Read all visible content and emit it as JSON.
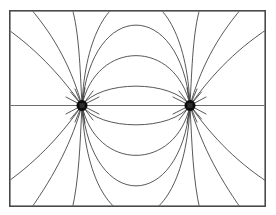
{
  "figure": {
    "background_color": "#ffffff",
    "frame": {
      "name": "border-rectangle",
      "x": 9,
      "y": 10,
      "width": 257,
      "height": 197,
      "stroke_color": "#4a4a4a",
      "stroke_width": 1.6
    },
    "line_color": "#3a3a3a",
    "axis_color": "#6d6d6d",
    "pole_color": "#0b0b0b"
  },
  "chart_data": {
    "type": "line",
    "subtitle": "",
    "xlabel": "",
    "ylabel": "",
    "grid": false,
    "legend": "none",
    "xlim": [
      0,
      276
    ],
    "ylim": [
      0,
      215
    ],
    "poles": [
      {
        "label": "left-pole",
        "x": 82,
        "y": 105.5,
        "radius": 5.2,
        "polarity": "source"
      },
      {
        "label": "right-pole",
        "x": 190,
        "y": 105.5,
        "radius": 5.2,
        "polarity": "sink"
      }
    ],
    "axis_of_symmetry": {
      "label": "horizontal-axis",
      "x_start": 10,
      "x_end": 265,
      "y": 105.5
    },
    "inner_arc_bulges_upper": [
      14,
      36,
      58,
      78
    ],
    "inner_arc_bulges_lower": [
      14,
      36,
      58,
      80
    ],
    "edge_crossings": {
      "top": [
        72,
        200
      ],
      "bottom": [
        72,
        200
      ],
      "left": [
        30,
        181
      ],
      "right": [
        30,
        181
      ]
    },
    "series": [
      {
        "name": "inner-arcs-upper",
        "count": 4
      },
      {
        "name": "inner-arcs-lower",
        "count": 4
      },
      {
        "name": "outer-arcs-upper",
        "count": 6
      },
      {
        "name": "outer-arcs-lower",
        "count": 6
      },
      {
        "name": "axis",
        "count": 1
      }
    ]
  }
}
